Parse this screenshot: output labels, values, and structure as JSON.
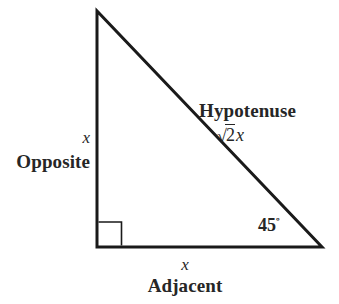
{
  "figure": {
    "background_color": "#ffffff",
    "stroke_color": "#1a1a1a"
  },
  "triangle": {
    "vertices": {
      "apex": [
        97,
        11
      ],
      "bottom_left": [
        97,
        247
      ],
      "bottom_right": [
        322,
        247
      ]
    },
    "stroke_width": 3,
    "right_angle_marker": {
      "at": "bottom_left",
      "size": 24,
      "stroke_width": 1.6
    }
  },
  "labels": {
    "opposite": {
      "variable": "x",
      "word": "Opposite"
    },
    "adjacent": {
      "variable": "x",
      "word": "Adjacent"
    },
    "hypotenuse": {
      "word": "Hypotenuse",
      "surd": "√",
      "radicand": "2",
      "factor": "x"
    },
    "angle": {
      "value": "45",
      "degree_symbol": "º"
    }
  }
}
